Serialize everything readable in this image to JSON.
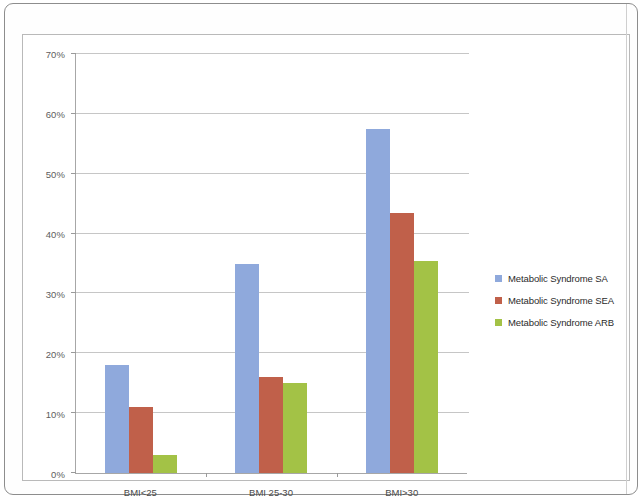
{
  "chart_data": {
    "type": "bar",
    "title": "",
    "subtitle": "",
    "xlabel": "",
    "ylabel": "",
    "categories": [
      "BMI<25",
      "BMI 25-30",
      "BMI>30"
    ],
    "series": [
      {
        "name": "Metabolic Syndrome SA",
        "color": "#8FA9DC",
        "values": [
          18,
          35,
          57.5
        ]
      },
      {
        "name": "Metabolic Syndrome SEA",
        "color": "#C0604A",
        "values": [
          11,
          16,
          43.5
        ]
      },
      {
        "name": "Metabolic Syndrome ARB",
        "color": "#A3C246",
        "values": [
          3,
          15,
          35.5
        ]
      }
    ],
    "ylim": [
      0,
      70
    ],
    "ytick_values": [
      0,
      10,
      20,
      30,
      40,
      50,
      60,
      70
    ],
    "ytick_labels": [
      "0%",
      "10%",
      "20%",
      "30%",
      "40%",
      "50%",
      "60%",
      "70%"
    ],
    "grid": true,
    "grid_axis": "y",
    "legend_position": "right",
    "value_unit": "percent"
  },
  "legend": {
    "items": [
      {
        "label": "Metabolic Syndrome SA"
      },
      {
        "label": "Metabolic Syndrome SEA"
      },
      {
        "label": "Metabolic Syndrome ARB"
      }
    ]
  },
  "colors": {
    "series_blue": "#8FA9DC",
    "series_red": "#C0604A",
    "series_green": "#A3C246",
    "gridline": "#C6C6C6",
    "axis": "#A7A7A7",
    "tick_text": "#5D5D5D",
    "frame": "#B9B9B9",
    "page_border": "#8D8D8D"
  }
}
